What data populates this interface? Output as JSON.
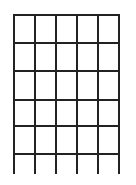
{
  "diagram": {
    "type": "chord-diagram-grid",
    "strings": 6,
    "frets": 5,
    "string_x": [
      14,
      35,
      56,
      77,
      98,
      119
    ],
    "fret_y": [
      15,
      43,
      71,
      100,
      126,
      154
    ],
    "string_bottom_y": 174,
    "line_color": "#222222",
    "line_width": 2,
    "background": "#ffffff",
    "markers": []
  }
}
